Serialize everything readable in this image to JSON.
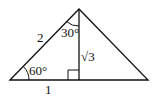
{
  "diagram": {
    "type": "right-triangle-30-60-90",
    "stroke_color": "#111111",
    "labels": {
      "hypotenuse": "2",
      "apex_angle": "30°",
      "altitude": "√3",
      "base_angle": "60°",
      "base_segment": "1"
    }
  }
}
